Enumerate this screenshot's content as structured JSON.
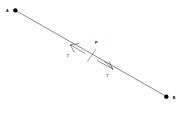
{
  "figure": {
    "background_color": "#ffffff",
    "stroke_color": "#000000",
    "width": 190,
    "height": 116,
    "endpoints": [
      {
        "name": "A",
        "label": "A",
        "x": 46,
        "y": 31,
        "label_x": 22,
        "label_y": 36
      },
      {
        "name": "B",
        "label": "B",
        "x": 499,
        "y": 290,
        "label_x": 520,
        "label_y": 297
      }
    ],
    "marked_point": {
      "name": "P",
      "label": "P",
      "x": 277,
      "y": 162,
      "label_x": 287,
      "label_y": 130
    },
    "vectors": [
      {
        "name": "tension-toward-a",
        "label": "T",
        "direction": "up-left",
        "label_x": 203,
        "label_y": 168
      },
      {
        "name": "tension-toward-b",
        "label": "T",
        "direction": "down-right",
        "label_x": 322,
        "label_y": 228
      }
    ]
  }
}
